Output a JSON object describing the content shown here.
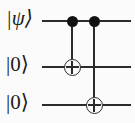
{
  "figure": {
    "name": "quantum-circuit-diagram",
    "type": "quantum-circuit",
    "background_color": "#fbfbfb",
    "ink_color": "#2b2b2b",
    "width": 135,
    "height": 123
  },
  "qubits": [
    {
      "id": "q0",
      "label": "|ψ⟩",
      "wire_y": 20,
      "style": "italic"
    },
    {
      "id": "q1",
      "label": "|0⟩",
      "wire_y": 66,
      "style": "upright"
    },
    {
      "id": "q2",
      "label": "|0⟩",
      "wire_y": 104,
      "style": "upright"
    }
  ],
  "wires": {
    "start_x": 42,
    "end_x": 131,
    "stroke": "#2b2b2b"
  },
  "gates": [
    {
      "id": "cnot-0",
      "type": "CNOT",
      "control_qubit": "q0",
      "target_qubit": "q1",
      "column_x": 71,
      "control_symbol": "filled-dot",
      "target_symbol": "oplus"
    },
    {
      "id": "cnot-1",
      "type": "CNOT",
      "control_qubit": "q0",
      "target_qubit": "q2",
      "column_x": 93,
      "control_symbol": "filled-dot",
      "target_symbol": "oplus"
    }
  ]
}
